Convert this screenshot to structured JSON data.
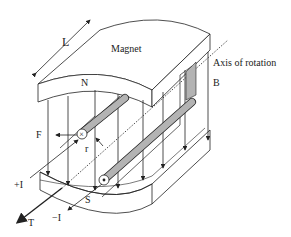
{
  "diagram": {
    "type": "dc-motor-principle",
    "labels": {
      "magnet": "Magnet",
      "north": "N",
      "south": "S",
      "length": "L",
      "axis": "Axis of rotation",
      "field": "B",
      "force": "F",
      "radius": "r",
      "torque": "T",
      "current_in": "+I",
      "current_out": "−I",
      "into_page_symbol": "×"
    },
    "colors": {
      "line": "#222222",
      "conductor_fill": "#b3b3b3",
      "background": "#ffffff"
    }
  }
}
